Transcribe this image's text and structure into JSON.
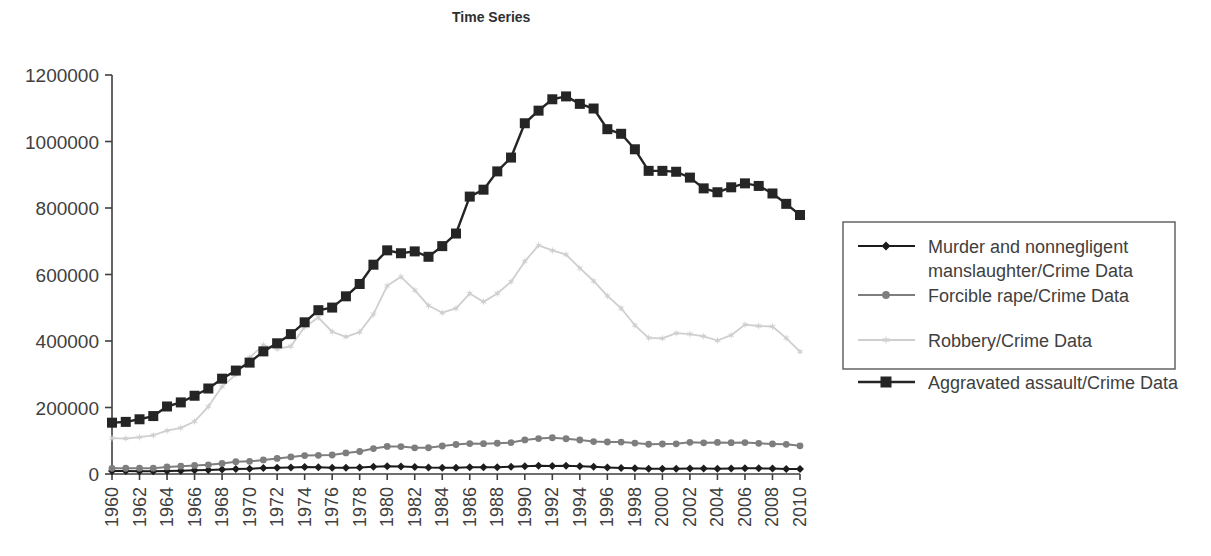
{
  "chart_data": {
    "type": "line",
    "title": "Time Series",
    "xlabel": "",
    "ylabel": "",
    "grid": false,
    "legend_position": "right",
    "xlim": [
      1960,
      2010
    ],
    "ylim": [
      0,
      1200000
    ],
    "ytick_labels": [
      "1200000",
      "1000000",
      "800000",
      "600000",
      "400000",
      "200000",
      "0"
    ],
    "ytick_values": [
      1200000,
      1000000,
      800000,
      600000,
      400000,
      200000,
      0
    ],
    "xtick_labels": [
      "1960",
      "1962",
      "1964",
      "1966",
      "1968",
      "1970",
      "1972",
      "1974",
      "1976",
      "1978",
      "1980",
      "1982",
      "1984",
      "1986",
      "1988",
      "1990",
      "1992",
      "1994",
      "1996",
      "1998",
      "2000",
      "2002",
      "2004",
      "2006",
      "2008",
      "2010"
    ],
    "x": [
      1960,
      1961,
      1962,
      1963,
      1964,
      1965,
      1966,
      1967,
      1968,
      1969,
      1970,
      1971,
      1972,
      1973,
      1974,
      1975,
      1976,
      1977,
      1978,
      1979,
      1980,
      1981,
      1982,
      1983,
      1984,
      1985,
      1986,
      1987,
      1988,
      1989,
      1990,
      1991,
      1992,
      1993,
      1994,
      1995,
      1996,
      1997,
      1998,
      1999,
      2000,
      2001,
      2002,
      2003,
      2004,
      2005,
      2006,
      2007,
      2008,
      2009,
      2010
    ],
    "series": [
      {
        "name": "Murder and nonnegligent manslaughter/Crime Data",
        "marker": "diamond",
        "color": "#1c1c1c",
        "line_width": 2.0,
        "values": [
          9110,
          8740,
          8530,
          8640,
          9360,
          9960,
          11040,
          12240,
          13800,
          14760,
          16000,
          17780,
          18670,
          19640,
          20710,
          20510,
          18780,
          19120,
          19560,
          21460,
          23040,
          22520,
          21010,
          19308,
          18692,
          18976,
          20613,
          20096,
          20675,
          21500,
          23438,
          24703,
          23760,
          24526,
          23326,
          21606,
          19645,
          18208,
          16974,
          15522,
          15586,
          16037,
          16229,
          16528,
          16148,
          16740,
          17030,
          16929,
          16442,
          15399,
          14748
        ]
      },
      {
        "name": "Forcible rape/Crime Data",
        "marker": "circle",
        "color": "#7e7e7e",
        "line_width": 2.0,
        "values": [
          17190,
          17220,
          17550,
          17650,
          21420,
          23410,
          25820,
          27620,
          31670,
          37170,
          37990,
          42260,
          46850,
          51400,
          55400,
          56090,
          57080,
          63500,
          67610,
          76390,
          82990,
          82500,
          78770,
          78918,
          84233,
          88671,
          91459,
          91111,
          92486,
          94504,
          102555,
          106593,
          109062,
          106014,
          102216,
          97470,
          96252,
          96153,
          93144,
          89411,
          90178,
          90863,
          95235,
          93883,
          95089,
          94347,
          94472,
          92160,
          90479,
          89241,
          84767
        ]
      },
      {
        "name": "Robbery/Crime Data",
        "marker": "star",
        "color": "#cfcfcf",
        "line_width": 1.8,
        "values": [
          107840,
          106670,
          110860,
          116470,
          130390,
          138690,
          157990,
          202910,
          262840,
          298850,
          349860,
          387700,
          376290,
          384220,
          442400,
          470500,
          427810,
          412610,
          426930,
          480700,
          565840,
          592910,
          553130,
          506567,
          485008,
          497874,
          542775,
          517704,
          542968,
          578326,
          639271,
          687732,
          672478,
          659870,
          618949,
          580509,
          535594,
          498534,
          447186,
          409371,
          408016,
          423557,
          420806,
          414235,
          401470,
          417438,
          449246,
          445125,
          443574,
          408742,
          367832
        ]
      },
      {
        "name": "Aggravated assault/Crime Data",
        "marker": "square",
        "color": "#252525",
        "line_width": 2.4,
        "values": [
          154320,
          156760,
          164570,
          174210,
          203050,
          215330,
          235330,
          257160,
          286700,
          311090,
          334970,
          368760,
          393090,
          420650,
          456210,
          492620,
          500530,
          534350,
          571460,
          629480,
          672650,
          663900,
          669480,
          653294,
          685349,
          723246,
          834322,
          855088,
          910092,
          951707,
          1054863,
          1092739,
          1126974,
          1135607,
          1113179,
          1099207,
          1037049,
          1023201,
          976583,
          911740,
          911706,
          909023,
          891407,
          859030,
          847381,
          862220,
          874096,
          866358,
          843683,
          812514,
          778901
        ]
      }
    ]
  },
  "legend": {
    "entries": [
      {
        "label_line1": "Murder and nonnegligent",
        "label_line2": "manslaughter/Crime Data"
      },
      {
        "label_line1": "Forcible rape/Crime Data",
        "label_line2": ""
      },
      {
        "label_line1": "Robbery/Crime Data",
        "label_line2": ""
      },
      {
        "label_line1": "Aggravated assault/Crime Data",
        "label_line2": ""
      }
    ]
  },
  "colors": {
    "murder": "#1c1c1c",
    "rape": "#7e7e7e",
    "robbery": "#cfcfcf",
    "assault": "#252525",
    "axis": "#3f3f3f",
    "text": "#404040",
    "background": "#ffffff"
  }
}
